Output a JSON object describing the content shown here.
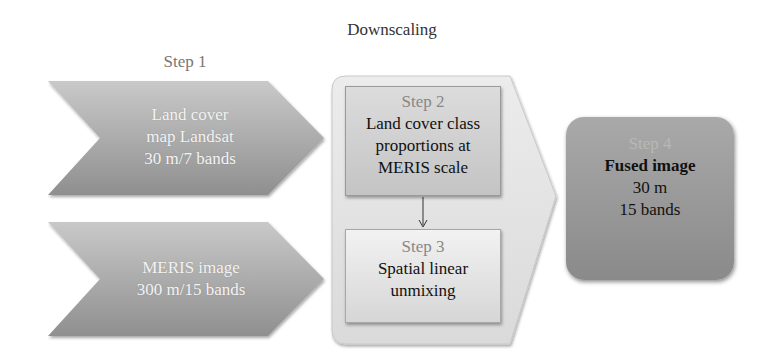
{
  "diagram": {
    "title": "Downscaling",
    "step1": {
      "label": "Step 1",
      "inputs": [
        {
          "lines": [
            "Land cover",
            "map Landsat",
            "30 m/7 bands"
          ]
        },
        {
          "lines": [
            "MERIS image",
            "300 m/15 bands"
          ]
        }
      ]
    },
    "step2": {
      "label": "Step 2",
      "lines": [
        "Land cover class",
        "proportions at",
        "MERIS scale"
      ]
    },
    "step3": {
      "label": "Step 3",
      "lines": [
        "Spatial linear",
        "unmixing"
      ]
    },
    "step4": {
      "label": "Step 4",
      "title": "Fused image",
      "lines": [
        "30 m",
        "15 bands"
      ]
    },
    "colors": {
      "chevron_dark": "#8c8c8c",
      "chevron_light": "#c8c8c8",
      "container": "#e4e4e4",
      "fused_box": "#999999"
    }
  }
}
